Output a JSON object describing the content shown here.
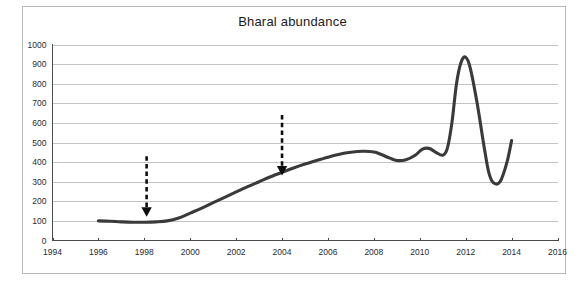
{
  "figure": {
    "title": "Bharal abundance",
    "background_color": "#ffffff",
    "frame_color": "#b9b9b9",
    "series_color": "#3a3a3a",
    "grid_color": "#c3c3c3",
    "annotation_color": "#0d0d0d"
  },
  "chart_data": {
    "type": "line",
    "title": "Bharal abundance",
    "xlabel": "",
    "ylabel": "",
    "xlim": [
      1994,
      2016
    ],
    "ylim": [
      0,
      1000
    ],
    "xticks": [
      1994,
      1996,
      1998,
      2000,
      2002,
      2004,
      2006,
      2008,
      2010,
      2012,
      2014,
      2016
    ],
    "yticks": [
      0,
      100,
      200,
      300,
      400,
      500,
      600,
      700,
      800,
      900,
      1000
    ],
    "xtick_labels": [
      "1994",
      "1996",
      "1998",
      "2000",
      "2002",
      "2004",
      "2006",
      "2008",
      "2010",
      "2012",
      "2014",
      "2016"
    ],
    "ytick_labels": [
      "0",
      "100",
      "200",
      "300",
      "400",
      "500",
      "600",
      "700",
      "800",
      "900",
      "1000"
    ],
    "grid": true,
    "grid_axis": "y",
    "legend": false,
    "series": [
      {
        "name": "Bharal abundance",
        "x": [
          1996.0,
          1996.5,
          1997.0,
          1997.5,
          1998.0,
          1998.5,
          1999.0,
          1999.5,
          2000.0,
          2000.5,
          2001.0,
          2001.5,
          2002.0,
          2002.5,
          2003.0,
          2003.5,
          2004.0,
          2004.5,
          2005.0,
          2005.5,
          2006.0,
          2006.5,
          2007.0,
          2007.5,
          2008.0,
          2008.3,
          2008.7,
          2009.0,
          2009.4,
          2009.8,
          2010.1,
          2010.4,
          2010.7,
          2011.0,
          2011.2,
          2011.4,
          2011.6,
          2011.8,
          2012.0,
          2012.2,
          2012.5,
          2012.8,
          2013.0,
          2013.2,
          2013.5,
          2013.8,
          2014.0
        ],
        "y": [
          100,
          98,
          95,
          93,
          93,
          95,
          100,
          115,
          140,
          165,
          193,
          220,
          248,
          275,
          300,
          325,
          348,
          370,
          390,
          408,
          425,
          440,
          450,
          455,
          452,
          440,
          420,
          408,
          412,
          435,
          465,
          470,
          450,
          435,
          470,
          600,
          800,
          910,
          935,
          880,
          700,
          480,
          350,
          295,
          300,
          400,
          510
        ]
      }
    ],
    "annotations": [
      {
        "type": "down-arrow",
        "x": 1998.1,
        "y_from": 430,
        "y_to": 175,
        "style": "dashed",
        "label": ""
      },
      {
        "type": "down-arrow",
        "x": 2004.0,
        "y_from": 640,
        "y_to": 385,
        "style": "dashed",
        "label": ""
      }
    ]
  }
}
